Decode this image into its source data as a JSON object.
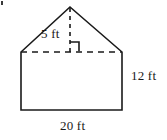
{
  "figure": {
    "kind": "pentagon-house-shape",
    "stroke_color": "#1a1a1a",
    "fill_color": "#ffffff",
    "labels": {
      "roof_height": "5 ft",
      "side_height": "12 ft",
      "base_width": "20 ft"
    },
    "geometry": {
      "apex": [
        70,
        7
      ],
      "roof_base_left": [
        21,
        52
      ],
      "roof_base_right": [
        122,
        52
      ],
      "bottom_left": [
        21,
        110
      ],
      "bottom_right": [
        122,
        110
      ],
      "altitude_from": [
        70,
        7
      ],
      "altitude_to": [
        70,
        52
      ],
      "right_angle_marker": [
        70,
        52
      ]
    },
    "icons": {
      "right_angle": "right-angle-marker"
    }
  }
}
